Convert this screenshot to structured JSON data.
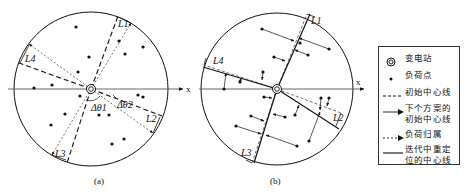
{
  "panels": [
    {
      "id": "a",
      "caption": "(a)",
      "axis_label": "x",
      "center": [
        91,
        89
      ],
      "radius": 77,
      "line_labels": [
        "L1",
        "L2",
        "L3",
        "L4"
      ],
      "angle_labels": [
        "Δθ1",
        "Δθ2"
      ]
    },
    {
      "id": "b",
      "caption": "(b)",
      "axis_label": "x",
      "center": [
        277,
        89
      ],
      "radius": 76,
      "line_labels": [
        "L1",
        "L2",
        "L3",
        "L4"
      ]
    }
  ],
  "legend": {
    "items": [
      {
        "symbol": "substation-icon",
        "label": "变电站"
      },
      {
        "symbol": "load-point-icon",
        "label": "负荷点"
      },
      {
        "symbol": "dashed-line-icon",
        "label": "初始中心线"
      },
      {
        "symbol": "solid-arrow-icon",
        "label": "下个方案的\n初始中心线"
      },
      {
        "symbol": "dotted-arrow-icon",
        "label": "负荷归属"
      },
      {
        "symbol": "solid-line-icon",
        "label": "迭代中重定\n位的中心线"
      }
    ]
  },
  "colors": {
    "ink": "#111111",
    "background": "#ffffff"
  }
}
